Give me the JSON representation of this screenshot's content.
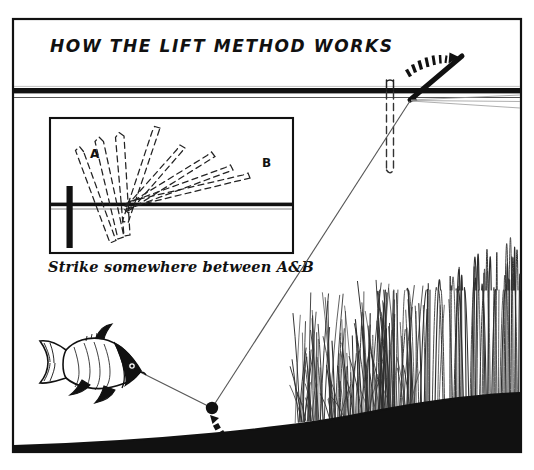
{
  "illustration": {
    "title": "HOW THE LIFT METHOD WORKS",
    "caption": "Strike somewhere between A&B",
    "labels": {
      "a": "A",
      "b": "B"
    },
    "icon_names": {
      "frame": "outer-frame",
      "waterline": "waterline",
      "inset": "inset-panel",
      "float_main": "float-icon",
      "rod": "fishing-rod-icon",
      "motion": "motion-arc-icon",
      "line": "fishing-line",
      "shot": "lead-shot-icon",
      "shot_trail": "shot-lift-trail",
      "fish": "fish-icon",
      "weeds": "reed-bed-icon",
      "riverbed": "riverbed"
    },
    "colors": {
      "ink": "#111111",
      "paper": "#ffffff",
      "weed": "#2a2a2a",
      "dash": "#1a1a1a"
    },
    "geometry": {
      "waterline_y": 92,
      "inset_box": [
        50,
        118,
        243,
        135
      ],
      "inset_waterline_y": 205,
      "riverbed_left_y": 446,
      "riverbed_right_y": 393
    }
  }
}
